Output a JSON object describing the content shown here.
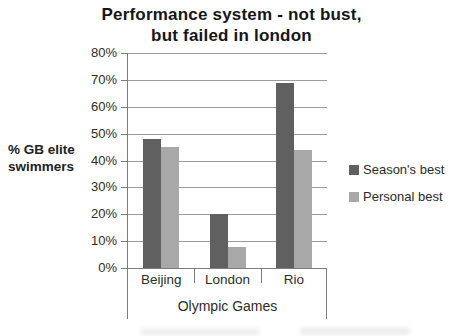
{
  "title": {
    "line1": "Performance system - not bust,",
    "line2": "but failed in london"
  },
  "labels": {
    "y_axis_line1": "% GB elite",
    "y_axis_line2": "swimmers",
    "x_axis_title": "Olympic Games"
  },
  "legend": [
    {
      "label": "Season's best",
      "color": "#606060"
    },
    {
      "label": "Personal best",
      "color": "#a8a8a8"
    }
  ],
  "colors": {
    "seasons_best_bar": "#606060",
    "personal_best_bar": "#a8a8a8",
    "gridline": "#9c9c9c",
    "axis": "#7d7d7d",
    "title_text": "#161616"
  },
  "chart_data": {
    "type": "bar",
    "title": "Performance system - not bust, but failed in london",
    "categories": [
      "Beijing",
      "London",
      "Rio"
    ],
    "series": [
      {
        "name": "Season's best",
        "color": "#606060",
        "values": [
          48,
          20,
          69
        ]
      },
      {
        "name": "Personal best",
        "color": "#a8a8a8",
        "values": [
          45,
          8,
          44
        ]
      }
    ],
    "xlabel": "Olympic Games",
    "ylabel": "% GB elite swimmers",
    "ylim": [
      0,
      80
    ],
    "ytick_step": 10,
    "ytick_format": "percent",
    "grid": true,
    "legend_position": "right"
  }
}
